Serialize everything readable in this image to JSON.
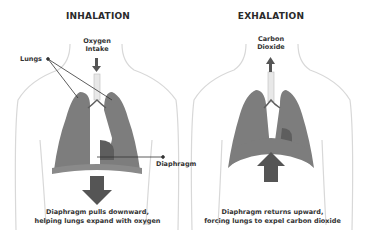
{
  "panels": [
    {
      "title": "INHALATION",
      "airflow_label_line1": "Oxygen",
      "airflow_label_line2": "Intake",
      "airflow_direction": "down",
      "diaphragm_arrow_direction": "down",
      "caption_line1": "Diaphragm pulls downward,",
      "caption_line2": "helping lungs expand with oxygen"
    },
    {
      "title": "EXHALATION",
      "airflow_label_line1": "Carbon",
      "airflow_label_line2": "Dioxide",
      "airflow_direction": "up",
      "diaphragm_arrow_direction": "up",
      "caption_line1": "Diaphragm returns upward,",
      "caption_line2": "forcing lungs to expel carbon dioxide"
    }
  ],
  "callouts": {
    "lungs": "Lungs",
    "diaphragm": "Diaphragm"
  },
  "colors": {
    "lung": "#7d7d7d",
    "lung_dark": "#5e5e5e",
    "arrow": "#555555",
    "body_outline": "#d8d8d8",
    "callout_line": "#333333"
  }
}
